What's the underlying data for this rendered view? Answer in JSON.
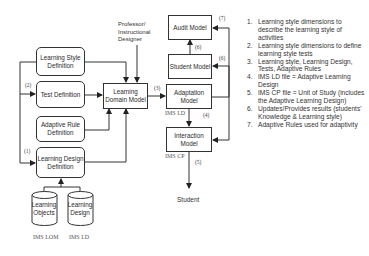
{
  "nodes": {
    "learning_style_definition": "Learning Style Definition",
    "test_definition": "Test Definition",
    "adaptive_rule_definition": "Adaptive Rule Definition",
    "learning_design_definition": "Learning Design Definition",
    "learning_domain_model": "Learning Domain Model",
    "adaptation_model": "Adaptation Model",
    "student_model": "Student Model",
    "audit_model": "Audit Model",
    "interaction_model": "Interaction Model",
    "learning_objects": "Learning Objects",
    "learning_design": "Learning Design",
    "professor": "Professor/ Instructional Designer",
    "student": "Student"
  },
  "annotations": {
    "ims_lom": "IMS LOM",
    "ims_ld_bottom": "IMS LD",
    "ims_ld": "IMS LD",
    "ims_cp": "IMS CP"
  },
  "edge_labels": {
    "e1": "(1)",
    "e2": "(2)",
    "e3": "(3)",
    "e4": "(4)",
    "e5": "(5)",
    "e6a": "(6)",
    "e6b": "(6)",
    "e7": "(7)"
  },
  "legend": [
    {
      "num": "1.",
      "text": "Learning style dimensions to describe the learning style of activities"
    },
    {
      "num": "2.",
      "text": "Learning style dimensions to define learning style tests"
    },
    {
      "num": "3.",
      "text": "Learning style, Learning Design, Tests, Adaptive Rules"
    },
    {
      "num": "4.",
      "text": "IMS LD file = Adaptive Learning Design"
    },
    {
      "num": "5.",
      "text": "IMS CP file = Unit of Study (includes the Adaptive Learning Design)"
    },
    {
      "num": "6.",
      "text": "Updates/Provides results (students' Knowledge & Learning style)"
    },
    {
      "num": "7.",
      "text": "Adaptive Rules used for adaptivity"
    }
  ]
}
